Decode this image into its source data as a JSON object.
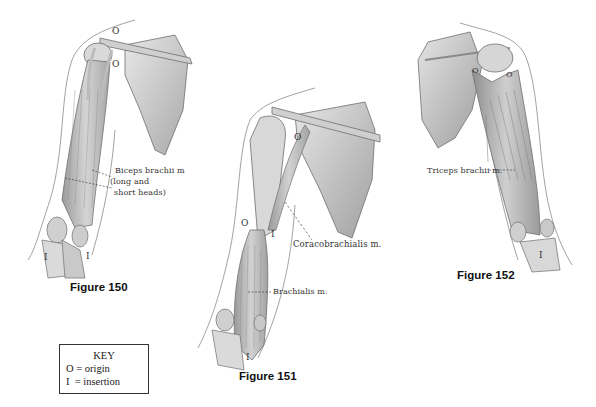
{
  "figures": [
    {
      "id": "150",
      "caption": "Figure 150",
      "labels": {
        "muscle_line1": "Biceps brachii m",
        "muscle_line2": "(long and",
        "muscle_line3": "short heads)"
      },
      "markers": {
        "origin_a": "O",
        "origin_b": "O",
        "insertion_a": "I",
        "insertion_b": "I"
      }
    },
    {
      "id": "151",
      "caption": "Figure 151",
      "labels": {
        "coracobrachialis": "Coracobrachialis m.",
        "brachialis": "Brachialis m."
      },
      "markers": {
        "origin_a": "O",
        "origin_b": "O",
        "insertion_a": "I",
        "insertion_b": "I"
      }
    },
    {
      "id": "152",
      "caption": "Figure 152",
      "labels": {
        "triceps": "Triceps brachii m."
      },
      "markers": {
        "insertion": "I"
      }
    }
  ],
  "key": {
    "title": "KEY",
    "rows": [
      {
        "symbol": "O",
        "meaning": "= origin"
      },
      {
        "symbol": "I",
        "meaning": " = insertion"
      }
    ]
  },
  "colors": {
    "bone": "#d6d6d6",
    "bone_shadow": "#9a9a9a",
    "muscle": "#bdbdbd",
    "outline": "#6e6e6e",
    "skin_line": "#8a8a8a"
  }
}
